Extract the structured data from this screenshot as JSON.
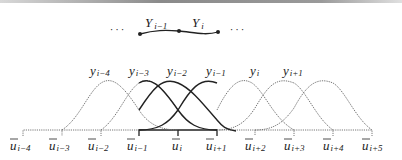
{
  "top_chain": {
    "left_dots": "· · ·",
    "right_dots": "· · ·",
    "segments": [
      {
        "label": "Y",
        "subscript": "i−1"
      },
      {
        "label": "Y",
        "subscript": "i"
      }
    ]
  },
  "curve_labels": [
    {
      "label": "y",
      "subscript": "i−4"
    },
    {
      "label": "y",
      "subscript": "i−3"
    },
    {
      "label": "y",
      "subscript": "i−2"
    },
    {
      "label": "y",
      "subscript": "i−1"
    },
    {
      "label": "y",
      "subscript": "i"
    },
    {
      "label": "y",
      "subscript": "i+1"
    }
  ],
  "knot_labels": [
    {
      "label": "u",
      "subscript": "i−4"
    },
    {
      "label": "u",
      "subscript": "i−3"
    },
    {
      "label": "u",
      "subscript": "i−2"
    },
    {
      "label": "u",
      "subscript": "i−1"
    },
    {
      "label": "u",
      "subscript": "i"
    },
    {
      "label": "u",
      "subscript": "i+1"
    },
    {
      "label": "u",
      "subscript": "i+2"
    },
    {
      "label": "u",
      "subscript": "i+3"
    },
    {
      "label": "u",
      "subscript": "i+4"
    },
    {
      "label": "u",
      "subscript": "i+5"
    }
  ],
  "colors": {
    "solid": "#222222",
    "dotted": "#777777"
  }
}
